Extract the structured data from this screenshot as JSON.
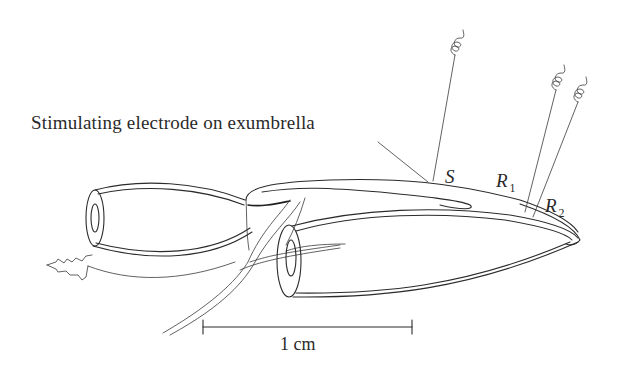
{
  "figure": {
    "caption_label": "Stimulating electrode on exumbrella",
    "electrodes": [
      {
        "id": "S",
        "letter": "S",
        "subscript": "",
        "role": "stimulating electrode"
      },
      {
        "id": "R1",
        "letter": "R",
        "subscript": "1",
        "role": "recording electrode"
      },
      {
        "id": "R2",
        "letter": "R",
        "subscript": "2",
        "role": "recording electrode"
      }
    ],
    "scale_bar": {
      "label": "1 cm",
      "x_start_px": 203,
      "x_end_px": 412,
      "y_px": 327
    },
    "colors": {
      "ink": "#2b2b2b",
      "background": "#ffffff"
    }
  }
}
